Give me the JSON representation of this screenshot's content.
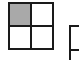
{
  "grid": {
    "rows": 2,
    "cols": 2,
    "cells": [
      {
        "row": 0,
        "col": 0,
        "filled": true,
        "color": "#a9a9a9"
      },
      {
        "row": 0,
        "col": 1,
        "filled": false,
        "color": "#ffffff"
      },
      {
        "row": 1,
        "col": 0,
        "filled": false,
        "color": "#ffffff"
      },
      {
        "row": 1,
        "col": 1,
        "filled": false,
        "color": "#ffffff"
      }
    ],
    "line_color": "#1a1a1a"
  },
  "partial_grid": {
    "visible": true
  }
}
